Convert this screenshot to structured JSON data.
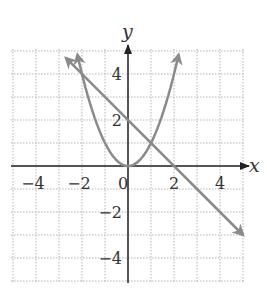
{
  "graph": {
    "x_axis_label": "x",
    "y_axis_label": "y",
    "x_ticks": [
      {
        "value": -4,
        "label": "−4"
      },
      {
        "value": -2,
        "label": "−2"
      },
      {
        "value": 0,
        "label": "0"
      },
      {
        "value": 2,
        "label": "2"
      },
      {
        "value": 4,
        "label": "4"
      }
    ],
    "y_ticks": [
      {
        "value": 4,
        "label": "4"
      },
      {
        "value": 2,
        "label": "2"
      },
      {
        "value": -2,
        "label": "−2"
      },
      {
        "value": -4,
        "label": "−4"
      }
    ],
    "curve_color": "#8a8a8a",
    "axis_color": "#222222",
    "grid_color": "#b5b5b5"
  },
  "chart_data": {
    "type": "line",
    "title": "",
    "xlabel": "x",
    "ylabel": "y",
    "xlim": [
      -5,
      5
    ],
    "ylim": [
      -5,
      5
    ],
    "grid": true,
    "series": [
      {
        "name": "parabola y = x^2",
        "x": [
          -2.2,
          -2,
          -1,
          0,
          1,
          2,
          2.2
        ],
        "y": [
          4.84,
          4,
          1,
          0,
          1,
          4,
          4.84
        ]
      },
      {
        "name": "line y = -x + 2",
        "x": [
          -3,
          -2,
          0,
          1,
          2,
          5
        ],
        "y": [
          5,
          4,
          2,
          1,
          0,
          -3
        ]
      }
    ],
    "intersections": [
      [
        -2,
        4
      ],
      [
        1,
        1
      ]
    ]
  }
}
